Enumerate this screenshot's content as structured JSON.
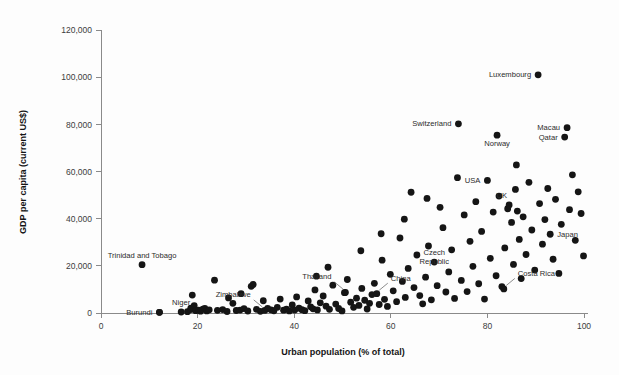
{
  "chart_data": {
    "type": "scatter",
    "title": "",
    "xlabel": "Urban population (% of total)",
    "ylabel": "GDP per capita (current US$)",
    "xlim": [
      0,
      100
    ],
    "ylim": [
      0,
      120000
    ],
    "xticks": [
      0,
      20,
      40,
      60,
      80,
      100
    ],
    "xtick_labels": [
      "0",
      "20",
      "40",
      "60",
      "80",
      "100"
    ],
    "yticks": [
      0,
      20000,
      40000,
      60000,
      80000,
      100000,
      120000
    ],
    "ytick_labels": [
      "0",
      "20,000",
      "40,000",
      "60,000",
      "80,000",
      "100,000",
      "120,000"
    ],
    "grid": false,
    "legend": false,
    "marker_color": "#151515",
    "marker_size": 3.4,
    "points": [
      {
        "x": 12.1,
        "y": 270
      },
      {
        "x": 8.5,
        "y": 20500,
        "label": "Trinidad and Tobago",
        "label_pos": "above-mid"
      },
      {
        "x": 16.6,
        "y": 420,
        "label": "Niger",
        "label_pos": "above-mid"
      },
      {
        "x": 12.1,
        "y": 270,
        "label": "Burundi",
        "label_pos": "left"
      },
      {
        "x": 17.9,
        "y": 560
      },
      {
        "x": 18.6,
        "y": 1480
      },
      {
        "x": 18.6,
        "y": 2100
      },
      {
        "x": 18.9,
        "y": 7600
      },
      {
        "x": 19.3,
        "y": 3100
      },
      {
        "x": 19.6,
        "y": 990
      },
      {
        "x": 20.2,
        "y": 1240
      },
      {
        "x": 20.6,
        "y": 780
      },
      {
        "x": 21.1,
        "y": 1620
      },
      {
        "x": 21.5,
        "y": 1980
      },
      {
        "x": 21.9,
        "y": 900
      },
      {
        "x": 22.4,
        "y": 1350
      },
      {
        "x": 23.5,
        "y": 13900
      },
      {
        "x": 24.1,
        "y": 1120
      },
      {
        "x": 25.2,
        "y": 1460
      },
      {
        "x": 26.1,
        "y": 640
      },
      {
        "x": 27.3,
        "y": 4100
      },
      {
        "x": 28.0,
        "y": 1050
      },
      {
        "x": 28.8,
        "y": 1260
      },
      {
        "x": 29.6,
        "y": 1870
      },
      {
        "x": 30.4,
        "y": 840
      },
      {
        "x": 31.1,
        "y": 11300
      },
      {
        "x": 31.5,
        "y": 12100
      },
      {
        "x": 32.2,
        "y": 1540
      },
      {
        "x": 33.0,
        "y": 700
      },
      {
        "x": 33.6,
        "y": 5200
      },
      {
        "x": 33.9,
        "y": 1100,
        "label": "Zimbabwe",
        "label_pos": "leader-up-left"
      },
      {
        "x": 34.5,
        "y": 1900
      },
      {
        "x": 35.2,
        "y": 1350
      },
      {
        "x": 35.8,
        "y": 960
      },
      {
        "x": 36.5,
        "y": 2400
      },
      {
        "x": 37.1,
        "y": 5900
      },
      {
        "x": 37.8,
        "y": 1180
      },
      {
        "x": 38.4,
        "y": 1620
      },
      {
        "x": 39.0,
        "y": 880
      },
      {
        "x": 39.6,
        "y": 3400
      },
      {
        "x": 40.1,
        "y": 1240
      },
      {
        "x": 40.5,
        "y": 6800
      },
      {
        "x": 41.0,
        "y": 2050
      },
      {
        "x": 41.6,
        "y": 1400
      },
      {
        "x": 42.2,
        "y": 980
      },
      {
        "x": 42.9,
        "y": 5100
      },
      {
        "x": 43.4,
        "y": 2600
      },
      {
        "x": 43.9,
        "y": 1750
      },
      {
        "x": 44.3,
        "y": 9800
      },
      {
        "x": 44.8,
        "y": 1320
      },
      {
        "x": 45.4,
        "y": 4300
      },
      {
        "x": 46.0,
        "y": 7200
      },
      {
        "x": 46.6,
        "y": 2900
      },
      {
        "x": 47.3,
        "y": 1560
      },
      {
        "x": 48.0,
        "y": 11800
      },
      {
        "x": 48.6,
        "y": 3800
      },
      {
        "x": 49.2,
        "y": 1900
      },
      {
        "x": 49.9,
        "y": 860
      },
      {
        "x": 50.4,
        "y": 8600
      },
      {
        "x": 51.0,
        "y": 14200
      },
      {
        "x": 51.7,
        "y": 4600
      },
      {
        "x": 52.3,
        "y": 2400
      },
      {
        "x": 52.9,
        "y": 6300
      },
      {
        "x": 53.4,
        "y": 3200
      },
      {
        "x": 54.0,
        "y": 10400
      },
      {
        "x": 54.6,
        "y": 5400
      },
      {
        "x": 55.1,
        "y": 1700
      },
      {
        "x": 55.6,
        "y": 4100
      },
      {
        "x": 56.1,
        "y": 7800
      },
      {
        "x": 56.6,
        "y": 12600
      },
      {
        "x": 57.1,
        "y": 8200,
        "label": "China",
        "label_pos": "leader-up-right"
      },
      {
        "x": 57.6,
        "y": 3600
      },
      {
        "x": 58.2,
        "y": 22400
      },
      {
        "x": 58.7,
        "y": 5800
      },
      {
        "x": 59.3,
        "y": 2800
      },
      {
        "x": 59.9,
        "y": 16400
      },
      {
        "x": 50.6,
        "y": 8700,
        "label": "Thailand",
        "label_pos": "leader-up-left"
      },
      {
        "x": 60.5,
        "y": 9400
      },
      {
        "x": 61.2,
        "y": 4800
      },
      {
        "x": 61.9,
        "y": 31800
      },
      {
        "x": 62.4,
        "y": 13400
      },
      {
        "x": 63.0,
        "y": 6600
      },
      {
        "x": 63.6,
        "y": 18900
      },
      {
        "x": 64.2,
        "y": 51200
      },
      {
        "x": 64.8,
        "y": 10800
      },
      {
        "x": 65.4,
        "y": 24600
      },
      {
        "x": 66.0,
        "y": 7400
      },
      {
        "x": 66.6,
        "y": 3900
      },
      {
        "x": 67.2,
        "y": 15200
      },
      {
        "x": 67.8,
        "y": 28400
      },
      {
        "x": 68.4,
        "y": 5600
      },
      {
        "x": 69.0,
        "y": 21600,
        "label": "Czech Republic",
        "label_pos": "above-mid"
      },
      {
        "x": 69.6,
        "y": 11600
      },
      {
        "x": 70.2,
        "y": 44800
      },
      {
        "x": 70.8,
        "y": 36200
      },
      {
        "x": 71.4,
        "y": 8900
      },
      {
        "x": 72.0,
        "y": 17400
      },
      {
        "x": 72.6,
        "y": 26800
      },
      {
        "x": 73.2,
        "y": 6200
      },
      {
        "x": 74.0,
        "y": 80200,
        "label": "Switzerland",
        "label_pos": "left"
      },
      {
        "x": 74.6,
        "y": 13800
      },
      {
        "x": 75.2,
        "y": 41600
      },
      {
        "x": 75.8,
        "y": 9100
      },
      {
        "x": 76.4,
        "y": 30400
      },
      {
        "x": 77.0,
        "y": 19800
      },
      {
        "x": 77.6,
        "y": 47200
      },
      {
        "x": 78.2,
        "y": 12400
      },
      {
        "x": 78.8,
        "y": 34600
      },
      {
        "x": 79.4,
        "y": 5900
      },
      {
        "x": 80.0,
        "y": 56200,
        "label": "USA",
        "label_pos": "left"
      },
      {
        "x": 80.6,
        "y": 23200
      },
      {
        "x": 81.2,
        "y": 42800
      },
      {
        "x": 81.8,
        "y": 15800
      },
      {
        "x": 82.0,
        "y": 75400,
        "label": "Norway",
        "label_pos": "below-mid"
      },
      {
        "x": 82.4,
        "y": 49600
      },
      {
        "x": 83.0,
        "y": 11200
      },
      {
        "x": 83.4,
        "y": 10200,
        "label": "Costa Rica",
        "label_pos": "leader-up-right"
      },
      {
        "x": 83.6,
        "y": 27600
      },
      {
        "x": 84.2,
        "y": 44200
      },
      {
        "x": 84.5,
        "y": 45800,
        "label": "UK",
        "label_pos": "above-left"
      },
      {
        "x": 85.0,
        "y": 38400
      },
      {
        "x": 85.4,
        "y": 20600
      },
      {
        "x": 85.8,
        "y": 52400
      },
      {
        "x": 86.2,
        "y": 43200
      },
      {
        "x": 86.6,
        "y": 31200
      },
      {
        "x": 87.0,
        "y": 14600
      },
      {
        "x": 87.4,
        "y": 40800
      },
      {
        "x": 88.0,
        "y": 24800
      },
      {
        "x": 88.6,
        "y": 55400
      },
      {
        "x": 89.2,
        "y": 35200
      },
      {
        "x": 89.8,
        "y": 18200
      },
      {
        "x": 90.5,
        "y": 101000,
        "label": "Luxembourg",
        "label_pos": "left"
      },
      {
        "x": 90.8,
        "y": 46400
      },
      {
        "x": 91.4,
        "y": 29200
      },
      {
        "x": 91.9,
        "y": 39600
      },
      {
        "x": 92.5,
        "y": 52800
      },
      {
        "x": 93.0,
        "y": 33400,
        "label": "Japan",
        "label_pos": "right"
      },
      {
        "x": 93.6,
        "y": 22800
      },
      {
        "x": 94.1,
        "y": 48200
      },
      {
        "x": 94.8,
        "y": 16800
      },
      {
        "x": 95.3,
        "y": 37600
      },
      {
        "x": 96.0,
        "y": 74600,
        "label": "Qatar",
        "label_pos": "left"
      },
      {
        "x": 96.5,
        "y": 78600,
        "label": "Macau",
        "label_pos": "left"
      },
      {
        "x": 97.0,
        "y": 43800
      },
      {
        "x": 97.6,
        "y": 58600
      },
      {
        "x": 98.2,
        "y": 30800
      },
      {
        "x": 98.8,
        "y": 51400
      },
      {
        "x": 99.4,
        "y": 42200
      },
      {
        "x": 99.9,
        "y": 24200
      },
      {
        "x": 86.0,
        "y": 62800
      },
      {
        "x": 73.8,
        "y": 57400
      },
      {
        "x": 67.5,
        "y": 48600
      },
      {
        "x": 62.8,
        "y": 39800
      },
      {
        "x": 58.0,
        "y": 33600
      },
      {
        "x": 53.8,
        "y": 26400
      },
      {
        "x": 47.0,
        "y": 19400
      },
      {
        "x": 44.6,
        "y": 15600
      },
      {
        "x": 29.0,
        "y": 8200
      },
      {
        "x": 26.4,
        "y": 6400
      }
    ]
  }
}
